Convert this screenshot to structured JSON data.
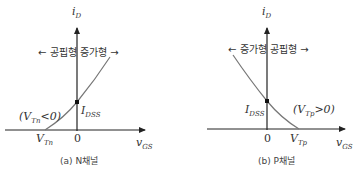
{
  "panels": [
    {
      "id": "n-channel",
      "caption": "(a) N채널",
      "y_axis_label": "i",
      "y_axis_sub": "D",
      "x_axis_label": "v",
      "x_axis_sub": "GS",
      "region_labels": {
        "left": "← 공핍형",
        "right": "증가형 →"
      },
      "origin_label": "0",
      "threshold_label": "V",
      "threshold_sub": "Tn",
      "idss_label": "I",
      "idss_sub": "DSS",
      "condition": {
        "open": "(V",
        "sub": "Tn",
        "close": "<0)"
      }
    },
    {
      "id": "p-channel",
      "caption": "(b) P채널",
      "y_axis_label": "i",
      "y_axis_sub": "D",
      "x_axis_label": "v",
      "x_axis_sub": "GS",
      "region_labels": {
        "left": "← 증가형",
        "right": "공핍형 →"
      },
      "origin_label": "0",
      "threshold_label": "V",
      "threshold_sub": "Tp",
      "idss_label": "I",
      "idss_sub": "DSS",
      "condition": {
        "open": "(V",
        "sub": "Tp",
        "close": ">0)"
      }
    }
  ],
  "colors": {
    "axis": "#222222",
    "curve": "#777777",
    "text": "#333333"
  }
}
